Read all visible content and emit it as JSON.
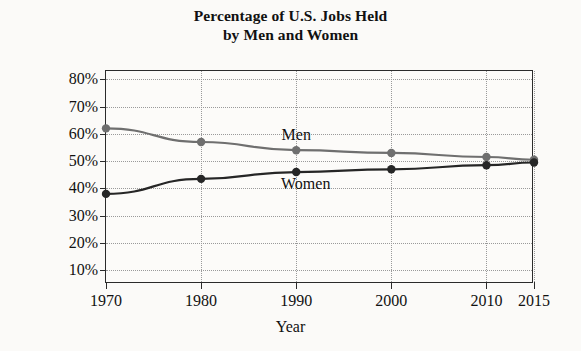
{
  "chart_data": {
    "type": "line",
    "title": "Percentage of U.S. Jobs Held by Men and Women",
    "title_lines": [
      "Percentage of U.S. Jobs Held",
      "by Men and Women"
    ],
    "xlabel": "Year",
    "ylabel": "Percentage of Jobs",
    "x": [
      1970,
      1980,
      1990,
      2000,
      2010,
      2015
    ],
    "categories": [
      "1970",
      "1980",
      "1990",
      "2000",
      "2010",
      "2015"
    ],
    "xtick_labels": [
      "1970",
      "1980",
      "1990",
      "2000",
      "2010",
      "2015"
    ],
    "ytick_labels": [
      "10%",
      "20%",
      "30%",
      "40%",
      "50%",
      "60%",
      "70%",
      "80%"
    ],
    "ytick_values": [
      10,
      20,
      30,
      40,
      50,
      60,
      70,
      80
    ],
    "xlim": [
      1970,
      2015
    ],
    "ylim": [
      5,
      83
    ],
    "grid": true,
    "legend_position": "inline-annotations",
    "series": [
      {
        "name": "Men",
        "label": "Men",
        "color": "#6f6f6f",
        "marker": "circle",
        "values": [
          62,
          57,
          54,
          53,
          51.5,
          50.5
        ]
      },
      {
        "name": "Women",
        "label": "Women",
        "color": "#262626",
        "marker": "circle",
        "values": [
          38,
          43.5,
          46,
          47,
          48.5,
          49.5
        ]
      }
    ],
    "annotations": [
      {
        "text": "Men",
        "x": 1990,
        "y": 59.5
      },
      {
        "text": "Women",
        "x": 1991,
        "y": 41.5
      }
    ],
    "colors": {
      "men_line": "#6f6f6f",
      "women_line": "#262626",
      "axis": "#2b2b2b",
      "grid": "#9a9a9a",
      "background": "#fbfaf8"
    }
  }
}
